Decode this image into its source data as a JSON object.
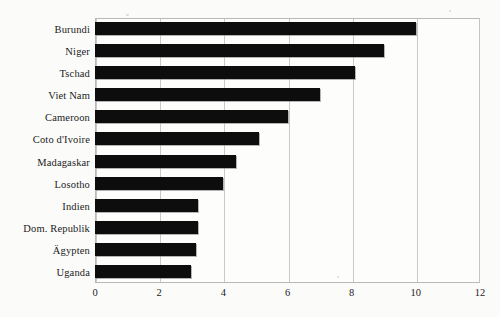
{
  "chart_data": {
    "type": "bar",
    "orientation": "horizontal",
    "title": "",
    "subtitle": "",
    "xlabel": "",
    "ylabel": "",
    "xlim": [
      0,
      12
    ],
    "xticks": [
      0,
      2,
      4,
      6,
      8,
      10,
      12
    ],
    "grid": "vertical",
    "legend": "none",
    "categories": [
      "Burundi",
      "Niger",
      "Tschad",
      "Viet Nam",
      "Cameroon",
      "Coto d'Ivoire",
      "Madagaskar",
      "Losotho",
      "Indien",
      "Dom. Republik",
      "Ägypten",
      "Uganda"
    ],
    "values": [
      10.0,
      9.0,
      8.1,
      7.0,
      6.0,
      5.1,
      4.4,
      4.0,
      3.2,
      3.2,
      3.15,
      3.0
    ],
    "series": [
      {
        "name": "series-1",
        "values": [
          10.0,
          9.0,
          8.1,
          7.0,
          6.0,
          5.1,
          4.4,
          4.0,
          3.2,
          3.2,
          3.15,
          3.0
        ],
        "color": "#0d0d0d"
      }
    ],
    "bar_color": "#0d0d0d",
    "background_color": "#fbfbfa",
    "grid_color": "#c9c9c9",
    "axis_color": "#b9b9b9"
  }
}
